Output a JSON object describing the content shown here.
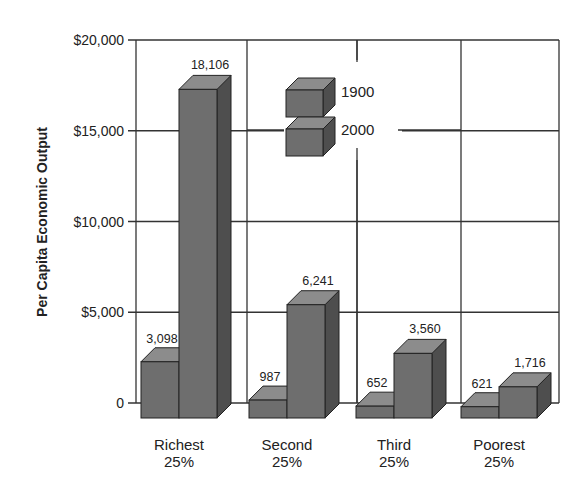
{
  "chart_data": {
    "type": "bar",
    "style": "3d-grouped",
    "title": "",
    "xlabel": "",
    "ylabel": "Per Capita Economic Output",
    "ylim": [
      0,
      20000
    ],
    "yticks": [
      0,
      5000,
      10000,
      15000,
      20000
    ],
    "ytick_labels": [
      "0",
      "$5,000",
      "$10,000",
      "$15,000",
      "$20,000"
    ],
    "grid": true,
    "categories": [
      "Richest 25%",
      "Second 25%",
      "Third 25%",
      "Poorest 25%"
    ],
    "category_lines": [
      [
        "Richest",
        "25%"
      ],
      [
        "Second",
        "25%"
      ],
      [
        "Third",
        "25%"
      ],
      [
        "Poorest",
        "25%"
      ]
    ],
    "series": [
      {
        "name": "1900",
        "values": [
          3098,
          987,
          652,
          621
        ],
        "labels": [
          "3,098",
          "987",
          "652",
          "621"
        ]
      },
      {
        "name": "2000",
        "values": [
          18106,
          6241,
          3560,
          1716
        ],
        "labels": [
          "18,106",
          "6,241",
          "3,560",
          "1,716"
        ]
      }
    ],
    "legend": {
      "position": "upper-center-inside",
      "entries": [
        "1900",
        "2000"
      ]
    },
    "colors": {
      "front": "#6e6e6e",
      "top": "#8c8c8c",
      "side": "#4e4e4e",
      "grid": "#333333"
    }
  }
}
